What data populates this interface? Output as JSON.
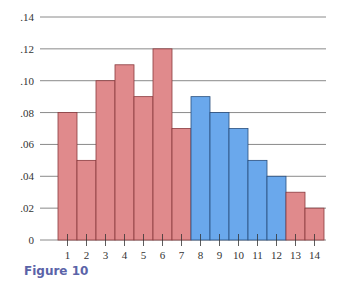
{
  "chart_data": {
    "type": "bar",
    "title": "",
    "xlabel": "",
    "ylabel": "",
    "categories": [
      "1",
      "2",
      "3",
      "4",
      "5",
      "6",
      "7",
      "8",
      "9",
      "10",
      "11",
      "12",
      "13",
      "14"
    ],
    "values": [
      0.08,
      0.05,
      0.1,
      0.11,
      0.09,
      0.12,
      0.07,
      0.09,
      0.08,
      0.07,
      0.05,
      0.04,
      0.03,
      0.02
    ],
    "bar_colors": [
      "#e08a8c",
      "#e08a8c",
      "#e08a8c",
      "#e08a8c",
      "#e08a8c",
      "#e08a8c",
      "#e08a8c",
      "#6aa8ec",
      "#6aa8ec",
      "#6aa8ec",
      "#6aa8ec",
      "#6aa8ec",
      "#e08a8c",
      "#e08a8c"
    ],
    "highlight_range": [
      8,
      12
    ],
    "ylim": [
      0,
      0.14
    ],
    "yticks": [
      0,
      0.02,
      0.04,
      0.06,
      0.08,
      0.1,
      0.12,
      0.14
    ],
    "ytick_labels": [
      "0",
      ".02",
      ".04",
      ".06",
      ".08",
      ".10",
      ".12",
      ".14"
    ],
    "grid": true,
    "legend": null
  },
  "colors": {
    "base_bar": "#e08a8c",
    "base_bar_edge": "#8a3a3e",
    "highlight_bar": "#6aa8ec",
    "highlight_bar_edge": "#2a4f7e",
    "grid": "#8a8a8a",
    "caption": "#5b63a8"
  },
  "caption": "Figure 10"
}
